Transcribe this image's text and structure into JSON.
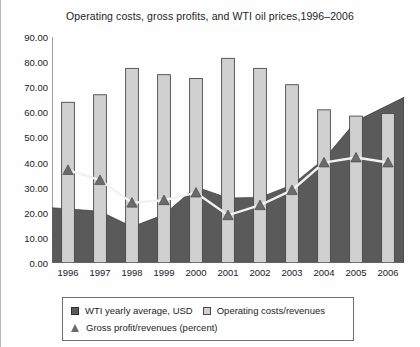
{
  "chart_data": {
    "type": "mixed",
    "title": "Operating costs, gross profits, and WTI oil prices,1996–2006",
    "xlabel": "",
    "ylabel": "",
    "ylim": [
      0,
      90
    ],
    "ytick_step": 10,
    "ytick_labels": [
      "90.00",
      "80.00",
      "70.00",
      "60.00",
      "50.00",
      "40.00",
      "30.00",
      "20.00",
      "10.00",
      "0.00"
    ],
    "grid": false,
    "legend_position": "bottom",
    "categories": [
      "1996",
      "1997",
      "1998",
      "1999",
      "2000",
      "2001",
      "2002",
      "2003",
      "2004",
      "2005",
      "2006"
    ],
    "series": [
      {
        "name": "WTI yearly average, USD",
        "type": "area",
        "color": "#5a5a5a",
        "values": [
          22.0,
          20.6,
          14.4,
          19.3,
          30.3,
          25.9,
          26.1,
          31.1,
          41.4,
          56.5,
          66.0
        ]
      },
      {
        "name": "Operating costs/revenues",
        "type": "bar",
        "color": "#d0d0d0",
        "values": [
          64.0,
          67.0,
          77.5,
          75.0,
          73.5,
          81.5,
          77.5,
          71.0,
          61.0,
          58.5,
          59.5
        ]
      },
      {
        "name": "Gross profit/revenues (percent)",
        "type": "line",
        "color": "#6b6b6b",
        "marker": "triangle",
        "values": [
          37.0,
          33.0,
          24.0,
          25.0,
          28.0,
          19.0,
          23.0,
          29.0,
          40.0,
          42.0,
          40.0
        ]
      }
    ]
  },
  "legend": {
    "items": [
      {
        "label": "WTI yearly average, USD",
        "marker": "dark-square"
      },
      {
        "label": "Operating costs/revenues",
        "marker": "light-square"
      },
      {
        "label": "Gross profit/revenues (percent)",
        "marker": "triangle"
      }
    ]
  },
  "colors": {
    "wti_area": "#5a5a5a",
    "operating_bar": "#d0d0d0",
    "gross_profit_line": "#f2f2f2",
    "gross_profit_marker": "#6b6b6b",
    "axis": "#6a6a6a",
    "text": "#222222"
  }
}
